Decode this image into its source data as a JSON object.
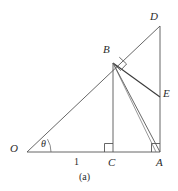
{
  "figure": {
    "caption": "(a)",
    "stroke_color": "#4a4a4a",
    "label_color": "#2b2b2b",
    "background": "#ffffff",
    "labels": {
      "O": "O",
      "A": "A",
      "B": "B",
      "C": "C",
      "D": "D",
      "E": "E",
      "theta": "θ",
      "segment_OC_length": "1"
    },
    "points": {
      "O": {
        "x": 27,
        "y": 152
      },
      "C": {
        "x": 113,
        "y": 152
      },
      "A": {
        "x": 160,
        "y": 152
      },
      "B": {
        "x": 113,
        "y": 63
      },
      "D": {
        "x": 160,
        "y": 26
      },
      "E": {
        "x": 160,
        "y": 97
      }
    },
    "segments": [
      {
        "name": "OD",
        "from": "O",
        "to": "D"
      },
      {
        "name": "OA",
        "from": "O",
        "to": "A"
      },
      {
        "name": "DA",
        "from": "D",
        "to": "A"
      },
      {
        "name": "BC",
        "from": "B",
        "to": "C"
      },
      {
        "name": "BE",
        "from": "B",
        "to": "E"
      },
      {
        "name": "BA",
        "from": "B",
        "to": "A"
      }
    ],
    "right_angles": [
      {
        "name": "right-angle-at-B",
        "vertex": "B"
      },
      {
        "name": "right-angle-at-C",
        "vertex": "C"
      },
      {
        "name": "right-angle-at-A",
        "vertex": "A"
      }
    ],
    "angle_marks": [
      {
        "name": "angle-theta-at-O",
        "vertex": "O",
        "label": "θ"
      }
    ]
  }
}
